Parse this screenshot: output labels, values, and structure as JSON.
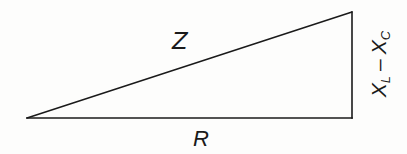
{
  "figure": {
    "type": "impedance-triangle",
    "background_color": "#fdfdfc",
    "line_color": "#1a1a1a",
    "labels": {
      "hypotenuse": "Z",
      "base": "R",
      "vertical_main_1": "X",
      "vertical_sub_1": "L",
      "vertical_operator": "–",
      "vertical_main_2": "X",
      "vertical_sub_2": "C"
    }
  },
  "chart_data": {
    "type": "diagram",
    "title": "",
    "shape": "right-triangle",
    "vertices": [
      {
        "name": "left-apex",
        "x": 27,
        "y": 118
      },
      {
        "name": "bottom-right",
        "x": 352,
        "y": 118
      },
      {
        "name": "top-right",
        "x": 352,
        "y": 12
      }
    ],
    "edges": [
      {
        "name": "base",
        "from": "left-apex",
        "to": "bottom-right",
        "label": "R"
      },
      {
        "name": "vertical",
        "from": "bottom-right",
        "to": "top-right",
        "label": "XL - XC"
      },
      {
        "name": "hypotenuse",
        "from": "left-apex",
        "to": "top-right",
        "label": "Z"
      }
    ],
    "base_length_px": 325,
    "vertical_length_px": 106,
    "grid": false,
    "legend": false
  }
}
